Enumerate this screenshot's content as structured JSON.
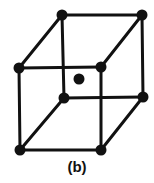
{
  "figure": {
    "caption": "(b)",
    "ink_color": "#111111",
    "background_color": "#ffffff",
    "edge_stroke_width": 3,
    "atom_radius": 5.5,
    "center_atom_radius": 5.5
  },
  "chart_data": {
    "type": "diagram",
    "subtitle": "(b)",
    "projection": "oblique",
    "atom_count": 9,
    "corner_atom_count": 8,
    "center_atom_count": 1,
    "vertices": [
      {
        "id": "back-top-left",
        "x": 62,
        "y": 15,
        "label": "back-top-left"
      },
      {
        "id": "back-top-right",
        "x": 142,
        "y": 15,
        "label": "back-top-right"
      },
      {
        "id": "front-top-left",
        "x": 19,
        "y": 68,
        "label": "front-top-left"
      },
      {
        "id": "front-top-right",
        "x": 101,
        "y": 67,
        "label": "front-top-right"
      },
      {
        "id": "back-bottom-left",
        "x": 64,
        "y": 98,
        "label": "back-bottom-left"
      },
      {
        "id": "back-bottom-right",
        "x": 143,
        "y": 97,
        "label": "back-bottom-right"
      },
      {
        "id": "front-bottom-left",
        "x": 20,
        "y": 150,
        "label": "front-bottom-left"
      },
      {
        "id": "front-bottom-right",
        "x": 101,
        "y": 150,
        "label": "front-bottom-right"
      },
      {
        "id": "body-center",
        "x": 79,
        "y": 79,
        "label": "body-center"
      }
    ],
    "edges": [
      {
        "from": "back-top-left",
        "to": "back-top-right"
      },
      {
        "from": "back-top-left",
        "to": "front-top-left"
      },
      {
        "from": "back-top-left",
        "to": "back-bottom-left"
      },
      {
        "from": "back-top-right",
        "to": "front-top-right"
      },
      {
        "from": "back-top-right",
        "to": "back-bottom-right"
      },
      {
        "from": "front-top-left",
        "to": "front-top-right"
      },
      {
        "from": "front-top-left",
        "to": "front-bottom-left"
      },
      {
        "from": "front-top-right",
        "to": "front-bottom-right"
      },
      {
        "from": "back-bottom-left",
        "to": "back-bottom-right"
      },
      {
        "from": "back-bottom-left",
        "to": "front-bottom-left"
      },
      {
        "from": "back-bottom-right",
        "to": "front-bottom-right"
      },
      {
        "from": "front-bottom-left",
        "to": "front-bottom-right"
      }
    ]
  }
}
